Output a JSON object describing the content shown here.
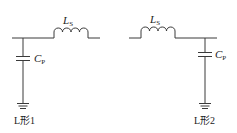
{
  "diagram": {
    "circuits": [
      {
        "name": "L形1",
        "label": "L形1",
        "inductor": {
          "symbol": "L",
          "subscript": "S"
        },
        "capacitor": {
          "symbol": "C",
          "subscript": "P"
        },
        "configuration": "shunt capacitor at input, series inductor"
      },
      {
        "name": "L形2",
        "label": "L形2",
        "inductor": {
          "symbol": "L",
          "subscript": "S"
        },
        "capacitor": {
          "symbol": "C",
          "subscript": "P"
        },
        "configuration": "series inductor, shunt capacitor at output"
      }
    ],
    "colors": {
      "line": "#3a3a3a",
      "background": "#ffffff"
    }
  }
}
